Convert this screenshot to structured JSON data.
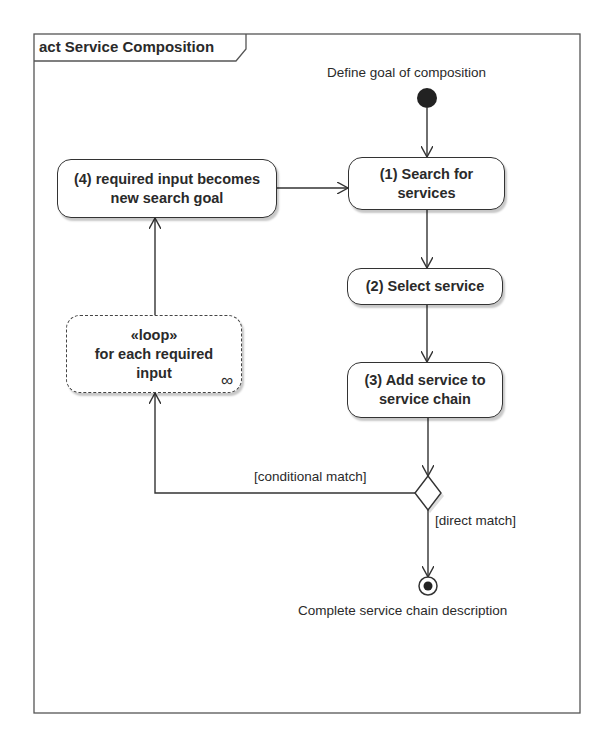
{
  "frame": {
    "title": "act Service Composition"
  },
  "nodes": {
    "initial": {
      "label": "Define goal of composition"
    },
    "search": {
      "label_line1": "(1) Search for",
      "label_line2": "services"
    },
    "select": {
      "label": "(2) Select service"
    },
    "add": {
      "label_line1": "(3) Add service to",
      "label_line2": "service chain"
    },
    "newgoal": {
      "label_line1": "(4) required input becomes",
      "label_line2": "new search goal"
    },
    "loop": {
      "stereotype": "«loop»",
      "label_line1": "for each required",
      "label_line2": "input",
      "icon": "∞"
    },
    "decision": {},
    "final": {
      "label": "Complete service chain description"
    }
  },
  "edges": {
    "conditional_guard": "[conditional match]",
    "direct_guard": "[direct match]"
  },
  "colors": {
    "line": "#333333",
    "initial_fill": "#222222",
    "background": "#ffffff"
  }
}
